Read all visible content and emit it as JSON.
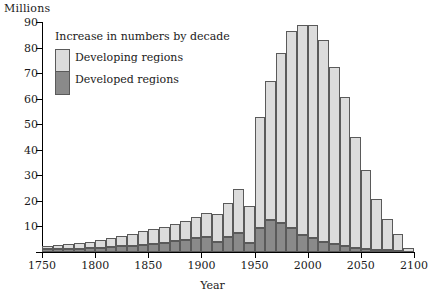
{
  "chart_data": {
    "type": "bar",
    "stacked": true,
    "title": "",
    "ylabel": "Millions",
    "xlabel": "Year",
    "ylim": [
      0,
      90
    ],
    "xlim": [
      1750,
      2100
    ],
    "ytick_values": [
      0,
      10,
      20,
      30,
      40,
      50,
      60,
      70,
      80,
      90
    ],
    "ytick_labels": [
      "",
      "10",
      "20",
      "30",
      "40",
      "50",
      "60",
      "70",
      "80",
      "90"
    ],
    "xtick_values": [
      1750,
      1800,
      1850,
      1900,
      1950,
      2000,
      2050,
      2100
    ],
    "xtick_labels": [
      "1750",
      "1800",
      "1850",
      "1900",
      "1950",
      "2000",
      "2050",
      "2100"
    ],
    "grid": false,
    "legend_position": "upper-left",
    "legend_title": "Increase in numbers by decade",
    "categories": [
      "1750",
      "1760",
      "1770",
      "1780",
      "1790",
      "1800",
      "1810",
      "1820",
      "1830",
      "1840",
      "1850",
      "1860",
      "1870",
      "1880",
      "1890",
      "1900",
      "1910",
      "1920",
      "1930",
      "1940",
      "1950",
      "1960",
      "1970",
      "1980",
      "1990",
      "2000",
      "2010",
      "2020",
      "2030",
      "2040",
      "2050",
      "2060",
      "2070",
      "2080",
      "2090"
    ],
    "series": [
      {
        "name": "Developed regions",
        "color": "#8a8a8a",
        "values": [
          1.0,
          1.1,
          1.2,
          1.3,
          1.5,
          1.7,
          1.9,
          2.2,
          2.5,
          2.9,
          3.3,
          3.7,
          4.2,
          4.7,
          5.3,
          5.8,
          4.0,
          6.0,
          7.6,
          3.5,
          9.5,
          12.5,
          11.5,
          9.5,
          6.5,
          5.5,
          4.0,
          3.0,
          2.2,
          1.6,
          1.2,
          0.8,
          0.6,
          0.4,
          0.2
        ]
      },
      {
        "name": "Developing regions",
        "color": "#dcdcdc",
        "values": [
          1.5,
          1.7,
          1.9,
          2.2,
          2.6,
          3.0,
          3.4,
          3.9,
          4.5,
          5.2,
          5.6,
          6.2,
          6.8,
          7.5,
          8.4,
          9.4,
          11.0,
          13.0,
          17.0,
          14.5,
          43.5,
          54.5,
          66.5,
          77.0,
          82.5,
          83.5,
          79.0,
          69.5,
          58.5,
          43.5,
          31.0,
          20.0,
          12.4,
          6.6,
          1.3
        ]
      }
    ],
    "totals": [
      2.5,
      2.8,
      3.1,
      3.5,
      4.1,
      4.7,
      5.3,
      6.1,
      7.0,
      8.1,
      8.9,
      9.9,
      11.0,
      12.2,
      13.7,
      15.2,
      15.0,
      19.0,
      24.6,
      18.0,
      53.0,
      67.0,
      78.0,
      86.5,
      89.0,
      89.0,
      83.0,
      72.5,
      60.7,
      45.1,
      32.2,
      20.8,
      13.0,
      7.0,
      1.5
    ]
  }
}
